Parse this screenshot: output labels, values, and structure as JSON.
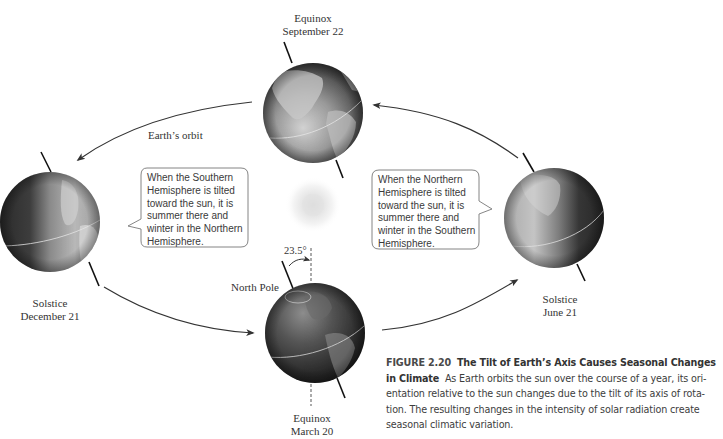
{
  "diagram": {
    "orbit_label": "Earth’s orbit",
    "tilt_angle_label": "23.5°",
    "north_pole_label": "North Pole",
    "positions": [
      {
        "id": "september",
        "event": "Equinox",
        "date": "September 22"
      },
      {
        "id": "december",
        "event": "Solstice",
        "date": "December 21"
      },
      {
        "id": "march",
        "event": "Equinox",
        "date": "March 20"
      },
      {
        "id": "june",
        "event": "Solstice",
        "date": "June 21"
      }
    ],
    "callouts": {
      "southern": {
        "lines": [
          "When the Southern",
          "Hemisphere is tilted",
          "toward the sun, it is",
          "summer there and",
          "winter in the Northern",
          "Hemisphere."
        ]
      },
      "northern": {
        "lines": [
          "When the Northern",
          "Hemisphere is tilted",
          "toward the sun, it is",
          "summer there and",
          "winter in the Southern",
          "Hemisphere."
        ]
      }
    },
    "sun_label": "sun"
  },
  "caption": {
    "figure_number": "FIGURE 2.20",
    "title_line1": "The Tilt of Earth’s Axis Causes Seasonal Changes",
    "title_line2": "in Climate",
    "body_line2": "As Earth orbits the sun over the course of a year, its ori-",
    "body_line3": "entation relative to the sun changes due to the tilt of its axis of rota-",
    "body_line4": "tion. The resulting changes in the intensity of solar radiation create",
    "body_line5": "seasonal climatic variation."
  },
  "colors": {
    "arrow": "#333333",
    "callout_border": "#777777",
    "globe_dark": "#2a2a2a",
    "globe_light": "#bdbdbd"
  }
}
